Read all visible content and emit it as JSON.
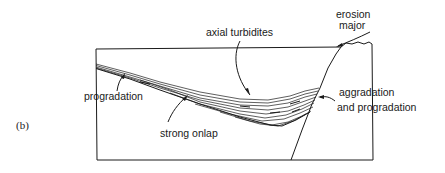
{
  "figure": {
    "panel_label": "(b)",
    "labels": {
      "axial_turbidites": "axial turbidites",
      "erosion": "erosion",
      "major": "major",
      "progradation": "progradation",
      "aggradation": "aggradation",
      "and_progradation": "and progradation",
      "strong_onlap": "strong onlap"
    },
    "colors": {
      "line": "#1a1a1a",
      "background": "#ffffff"
    }
  }
}
